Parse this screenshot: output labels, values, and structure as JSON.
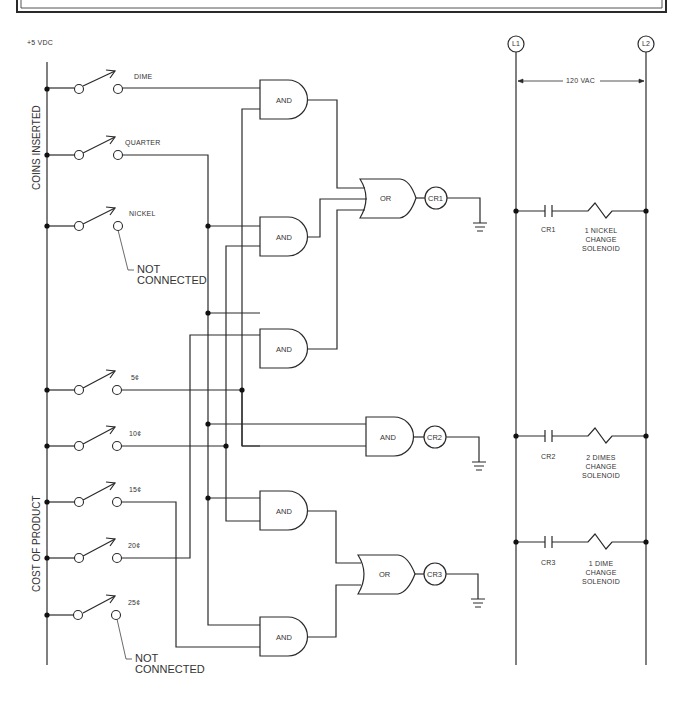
{
  "header_panel": {
    "visible_fragment": "top border frame (cropped)"
  },
  "supply": {
    "label": "+5 VDC"
  },
  "groups": {
    "coins_inserted": "COINS INSERTED",
    "cost_of_product": "COST OF PRODUCT"
  },
  "switches": [
    {
      "id": "dime",
      "label": "DIME"
    },
    {
      "id": "quarter",
      "label": "QUARTER"
    },
    {
      "id": "nickel",
      "label": "NICKEL"
    },
    {
      "id": "5c",
      "label": "5¢"
    },
    {
      "id": "10c",
      "label": "10¢"
    },
    {
      "id": "15c",
      "label": "15¢"
    },
    {
      "id": "20c",
      "label": "20¢"
    },
    {
      "id": "25c",
      "label": "25¢"
    }
  ],
  "notes": {
    "nickel_nc_line1": "NOT",
    "nickel_nc_line2": "CONNECTED",
    "q25_nc_line1": "NOT",
    "q25_nc_line2": "CONNECTED"
  },
  "gates": {
    "and1": "AND",
    "and2": "AND",
    "and3": "AND",
    "and4": "AND",
    "and5": "AND",
    "and6": "AND",
    "or1": "OR",
    "or2": "OR"
  },
  "relays": {
    "cr1": "CR1",
    "cr2": "CR2",
    "cr3": "CR3"
  },
  "ladder": {
    "l1": "L1",
    "l2": "L2",
    "voltage": "120 VAC",
    "rungs": [
      {
        "contact": "CR1",
        "load_line1": "1 NICKEL",
        "load_line2": "CHANGE",
        "load_line3": "SOLENOID"
      },
      {
        "contact": "CR2",
        "load_line1": "2 DIMES",
        "load_line2": "CHANGE",
        "load_line3": "SOLENOID"
      },
      {
        "contact": "CR3",
        "load_line1": "1 DIME",
        "load_line2": "CHANGE",
        "load_line3": "SOLENOID"
      }
    ]
  },
  "colors": {
    "line": "#2a2a2a",
    "text": "#333333",
    "background": "#ffffff"
  }
}
